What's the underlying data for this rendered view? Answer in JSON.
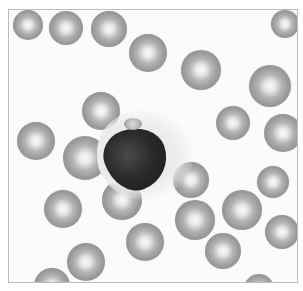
{
  "image": {
    "description": "Grayscale micrograph of a peripheral blood smear showing red blood cells surrounding a single white blood cell with a large dark nucleus and a small cluster of platelets",
    "colors": {
      "background": "#fbfbfb",
      "frame": "#bdbdbd",
      "rbc": "#9a9a9a",
      "nucleus": "#222222"
    },
    "rbc_cells": [
      {
        "x": 4,
        "y": 0,
        "d": 30
      },
      {
        "x": 40,
        "y": 1,
        "d": 34
      },
      {
        "x": 82,
        "y": 1,
        "d": 36
      },
      {
        "x": 120,
        "y": 24,
        "d": 38
      },
      {
        "x": 172,
        "y": 40,
        "d": 40
      },
      {
        "x": 240,
        "y": 55,
        "d": 42
      },
      {
        "x": 262,
        "y": 0,
        "d": 28
      },
      {
        "x": 73,
        "y": 82,
        "d": 38
      },
      {
        "x": 207,
        "y": 96,
        "d": 34
      },
      {
        "x": 255,
        "y": 104,
        "d": 38
      },
      {
        "x": 8,
        "y": 112,
        "d": 38
      },
      {
        "x": 54,
        "y": 126,
        "d": 44
      },
      {
        "x": 164,
        "y": 152,
        "d": 36
      },
      {
        "x": 248,
        "y": 156,
        "d": 32
      },
      {
        "x": 35,
        "y": 180,
        "d": 38
      },
      {
        "x": 93,
        "y": 170,
        "d": 40
      },
      {
        "x": 166,
        "y": 190,
        "d": 40
      },
      {
        "x": 213,
        "y": 180,
        "d": 40
      },
      {
        "x": 256,
        "y": 205,
        "d": 34
      },
      {
        "x": 117,
        "y": 213,
        "d": 38
      },
      {
        "x": 196,
        "y": 223,
        "d": 36
      },
      {
        "x": 58,
        "y": 233,
        "d": 38
      },
      {
        "x": 25,
        "y": 258,
        "d": 36
      },
      {
        "x": 235,
        "y": 264,
        "d": 30
      }
    ]
  }
}
